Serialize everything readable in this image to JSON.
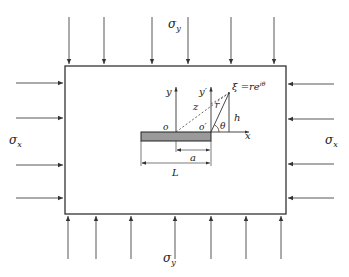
{
  "diagram": {
    "labels": {
      "sigma_y_top": "σ",
      "sigma_y_top_sub": "y",
      "sigma_y_bottom": "σ",
      "sigma_y_bottom_sub": "y",
      "sigma_x_left": "σ",
      "sigma_x_left_sub": "x",
      "sigma_x_right": "σ",
      "sigma_x_right_sub": "x",
      "y_axis": "y",
      "y_prime_axis": "y′",
      "x_axis": "x",
      "origin": "o",
      "origin_prime": "o′",
      "z": "z",
      "r": "r",
      "h": "h",
      "theta": "θ",
      "xi": "ξ =re",
      "xi_exp": "iθ",
      "a": "a",
      "L": "L"
    },
    "colors": {
      "line": "#333333",
      "crack_fill": "#9a9a9a",
      "background": "#ffffff"
    },
    "top_arrows_x": [
      69,
      104,
      152,
      188,
      231,
      274
    ],
    "bottom_arrows_x": [
      68,
      96,
      131,
      175,
      211,
      246,
      281
    ],
    "left_arrows_y": [
      83,
      118,
      165,
      198
    ],
    "right_arrows_y": [
      84,
      119,
      164,
      198
    ]
  }
}
